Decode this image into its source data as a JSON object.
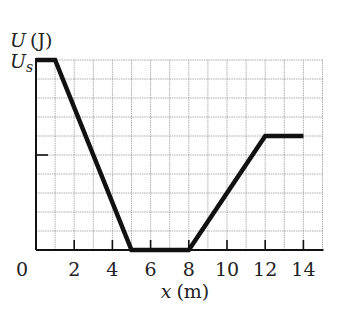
{
  "chart_data": {
    "type": "line",
    "title": "",
    "xlabel": "x (m)",
    "ylabel": "U (J)",
    "x_var": "x",
    "x_unit": "(m)",
    "y_var": "U",
    "y_unit": "(J)",
    "y_tick_label": "Us",
    "y_tick_label_main": "U",
    "y_tick_label_sub": "s",
    "xlim": [
      0,
      15
    ],
    "ylim": [
      0,
      1
    ],
    "x_ticks": [
      "0",
      "2",
      "4",
      "6",
      "8",
      "10",
      "12",
      "14"
    ],
    "grid": true,
    "grid_x_step": 1,
    "grid_y_step": 0.1,
    "series": [
      {
        "name": "U(x)",
        "color": "#111111",
        "x": [
          0,
          1,
          5,
          8,
          12,
          14
        ],
        "y_fraction_of_Us": [
          1.0,
          1.0,
          0.0,
          0.0,
          0.6,
          0.6
        ]
      }
    ],
    "annotations": [
      "half-height tick mark on y axis at 0.5 Us"
    ]
  }
}
